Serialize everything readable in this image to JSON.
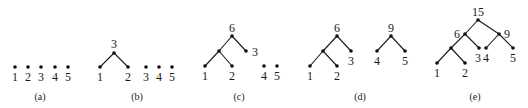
{
  "diagram": {
    "panels": [
      {
        "id": "a",
        "caption": "(a)",
        "caption_pos": [
          40,
          100
        ],
        "nodes": [
          {
            "x": 15,
            "y": 67,
            "label": "1",
            "lx": 15,
            "ly": 81
          },
          {
            "x": 28,
            "y": 67,
            "label": "2",
            "lx": 28,
            "ly": 81
          },
          {
            "x": 41,
            "y": 67,
            "label": "3",
            "lx": 41,
            "ly": 81
          },
          {
            "x": 55,
            "y": 67,
            "label": "4",
            "lx": 55,
            "ly": 81
          },
          {
            "x": 68,
            "y": 67,
            "label": "5",
            "lx": 68,
            "ly": 81
          }
        ],
        "edges": []
      },
      {
        "id": "b",
        "caption": "(b)",
        "caption_pos": [
          137,
          100
        ],
        "nodes": [
          {
            "x": 114,
            "y": 53,
            "label": "3",
            "lx": 114,
            "ly": 48
          },
          {
            "x": 100,
            "y": 67,
            "label": "1",
            "lx": 100,
            "ly": 81
          },
          {
            "x": 128,
            "y": 67,
            "label": "2",
            "lx": 128,
            "ly": 81
          },
          {
            "x": 146,
            "y": 67,
            "label": "3",
            "lx": 146,
            "ly": 81
          },
          {
            "x": 159,
            "y": 67,
            "label": "4",
            "lx": 159,
            "ly": 81
          },
          {
            "x": 172,
            "y": 67,
            "label": "5",
            "lx": 172,
            "ly": 81
          }
        ],
        "edges": [
          [
            0,
            1
          ],
          [
            0,
            2
          ]
        ]
      },
      {
        "id": "c",
        "caption": "(c)",
        "caption_pos": [
          239,
          100
        ],
        "nodes": [
          {
            "x": 232,
            "y": 36,
            "label": "6",
            "lx": 232,
            "ly": 32
          },
          {
            "x": 219,
            "y": 51,
            "label": "",
            "lx": 0,
            "ly": 0
          },
          {
            "x": 246,
            "y": 51,
            "label": "3",
            "lx": 252,
            "ly": 56,
            "anchor": "start"
          },
          {
            "x": 205,
            "y": 66,
            "label": "1",
            "lx": 205,
            "ly": 80
          },
          {
            "x": 232,
            "y": 66,
            "label": "2",
            "lx": 232,
            "ly": 80
          },
          {
            "x": 264,
            "y": 66,
            "label": "4",
            "lx": 264,
            "ly": 80
          },
          {
            "x": 277,
            "y": 66,
            "label": "5",
            "lx": 277,
            "ly": 80
          }
        ],
        "edges": [
          [
            0,
            1
          ],
          [
            0,
            2
          ],
          [
            1,
            3
          ],
          [
            1,
            4
          ]
        ]
      },
      {
        "id": "d",
        "caption": "(d)",
        "caption_pos": [
          360,
          100
        ],
        "nodes": [
          {
            "x": 337,
            "y": 36,
            "label": "6",
            "lx": 337,
            "ly": 32
          },
          {
            "x": 323,
            "y": 51,
            "label": "",
            "lx": 0,
            "ly": 0
          },
          {
            "x": 351,
            "y": 51,
            "label": "3",
            "lx": 351,
            "ly": 65
          },
          {
            "x": 310,
            "y": 66,
            "label": "1",
            "lx": 310,
            "ly": 80
          },
          {
            "x": 337,
            "y": 66,
            "label": "2",
            "lx": 337,
            "ly": 80
          },
          {
            "x": 391,
            "y": 36,
            "label": "9",
            "lx": 391,
            "ly": 32
          },
          {
            "x": 377,
            "y": 51,
            "label": "4",
            "lx": 377,
            "ly": 65
          },
          {
            "x": 405,
            "y": 51,
            "label": "5",
            "lx": 405,
            "ly": 65
          }
        ],
        "edges": [
          [
            0,
            1
          ],
          [
            0,
            2
          ],
          [
            1,
            3
          ],
          [
            1,
            4
          ],
          [
            5,
            6
          ],
          [
            5,
            7
          ]
        ]
      },
      {
        "id": "e",
        "caption": "(e)",
        "caption_pos": [
          475,
          100
        ],
        "nodes": [
          {
            "x": 478,
            "y": 20,
            "label": "15",
            "lx": 478,
            "ly": 16
          },
          {
            "x": 465,
            "y": 34,
            "label": "6",
            "lx": 460,
            "ly": 38,
            "anchor": "end"
          },
          {
            "x": 499,
            "y": 34,
            "label": "9",
            "lx": 504,
            "ly": 38,
            "anchor": "start"
          },
          {
            "x": 451,
            "y": 48,
            "label": "",
            "lx": 0,
            "ly": 0
          },
          {
            "x": 479,
            "y": 48,
            "label": "3",
            "lx": 478,
            "ly": 62
          },
          {
            "x": 486,
            "y": 48,
            "label": "4",
            "lx": 486,
            "ly": 62
          },
          {
            "x": 513,
            "y": 48,
            "label": "5",
            "lx": 513,
            "ly": 62
          },
          {
            "x": 437,
            "y": 63,
            "label": "1",
            "lx": 437,
            "ly": 77
          },
          {
            "x": 465,
            "y": 63,
            "label": "2",
            "lx": 465,
            "ly": 77
          }
        ],
        "edges": [
          [
            0,
            1
          ],
          [
            0,
            2
          ],
          [
            1,
            3
          ],
          [
            1,
            4
          ],
          [
            2,
            5
          ],
          [
            2,
            6
          ],
          [
            3,
            7
          ],
          [
            3,
            8
          ]
        ]
      }
    ]
  },
  "colors": {
    "background": "#ffffff",
    "ink": "#1a1a1a"
  }
}
